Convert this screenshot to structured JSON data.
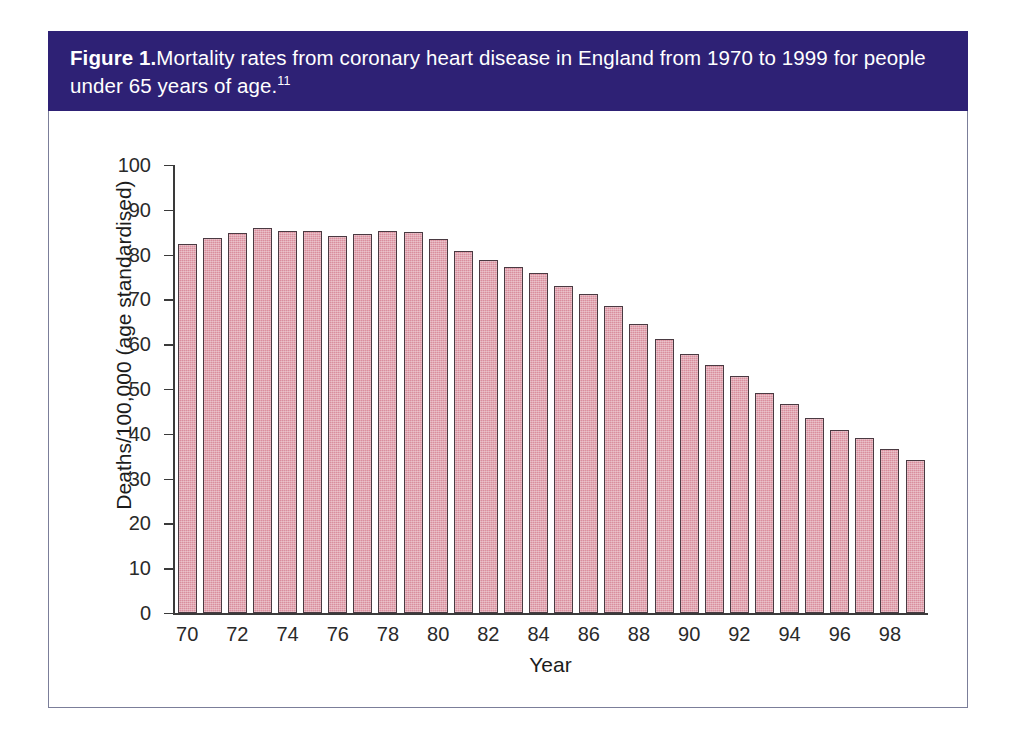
{
  "figure": {
    "label": "Figure 1.",
    "caption": "Mortality rates from coronary heart disease in England from 1970 to 1999 for people under 65 years of age.",
    "reference": "11",
    "banner_color": "#2e2175",
    "frame_color": "#7b7e99"
  },
  "chart_data": {
    "type": "bar",
    "title": "Mortality rates from coronary heart disease in England from 1970 to 1999 for people under 65 years of age.",
    "xlabel": "Year",
    "ylabel": "Deaths/100,000 (age standardised)",
    "ylim": [
      0,
      100
    ],
    "yticks": [
      0,
      10,
      20,
      30,
      40,
      50,
      60,
      70,
      80,
      90,
      100
    ],
    "grid": false,
    "legend": "none",
    "bar_color": "#d98e9d",
    "bar_edge_color": "#4a3a42",
    "categories": [
      "70",
      "71",
      "72",
      "73",
      "74",
      "75",
      "76",
      "77",
      "78",
      "79",
      "80",
      "81",
      "82",
      "83",
      "84",
      "85",
      "86",
      "87",
      "88",
      "89",
      "90",
      "91",
      "92",
      "93",
      "94",
      "95",
      "96",
      "97",
      "98",
      "99"
    ],
    "xtick_labels": [
      "70",
      "72",
      "74",
      "76",
      "78",
      "80",
      "82",
      "84",
      "86",
      "88",
      "90",
      "92",
      "94",
      "96",
      "98"
    ],
    "values": [
      82.4,
      83.6,
      84.8,
      85.9,
      85.3,
      85.2,
      84.2,
      84.7,
      85.3,
      85.0,
      83.4,
      80.8,
      78.8,
      77.2,
      75.8,
      73.0,
      71.3,
      68.5,
      64.5,
      61.1,
      57.8,
      55.3,
      52.8,
      49.2,
      46.6,
      43.6,
      40.9,
      39.1,
      36.7,
      34.2
    ]
  }
}
